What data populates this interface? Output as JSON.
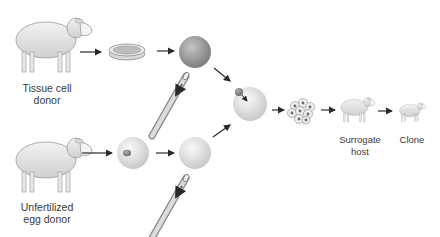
{
  "diagram": {
    "type": "cloning process flow",
    "labels": {
      "tissue_donor_line1": "Tissue cell",
      "tissue_donor_line2": "donor",
      "egg_donor_line1": "Unfertilized",
      "egg_donor_line2": "egg donor",
      "surrogate_line1": "Surrogate",
      "surrogate_line2": "host",
      "clone": "Clone"
    },
    "nodes": [
      {
        "id": "tissue-donor-sheep",
        "kind": "sheep"
      },
      {
        "id": "petri-dish",
        "kind": "culture dish"
      },
      {
        "id": "donor-cell",
        "kind": "cell (nucleus source)"
      },
      {
        "id": "egg-donor-sheep",
        "kind": "sheep"
      },
      {
        "id": "egg-cell-with-nucleus",
        "kind": "egg cell"
      },
      {
        "id": "enucleated-egg",
        "kind": "egg cell"
      },
      {
        "id": "fused-cell",
        "kind": "egg with transferred nucleus"
      },
      {
        "id": "embryo",
        "kind": "cell cluster"
      },
      {
        "id": "surrogate-sheep",
        "kind": "sheep"
      },
      {
        "id": "clone-lamb",
        "kind": "lamb"
      }
    ],
    "colors": {
      "arrow": "#2a2a2a",
      "text": "#3a3a3a",
      "donor_cell": "#9a9a9a",
      "egg_cell": "#e4e4e4"
    }
  }
}
